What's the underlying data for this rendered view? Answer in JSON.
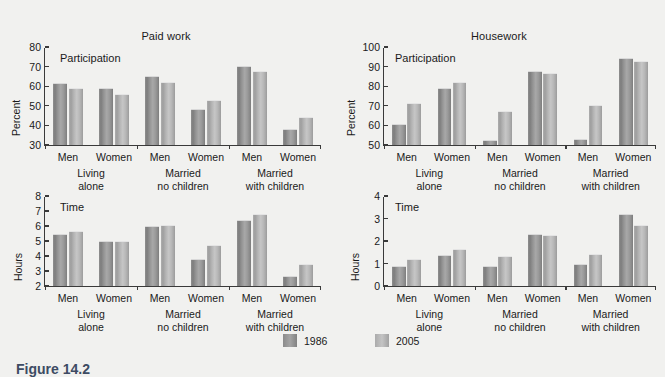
{
  "figure": {
    "caption": "Figure 14.2",
    "legend": [
      {
        "label": "1986",
        "key": "y1986",
        "color": "#8f8f8f"
      },
      {
        "label": "2005",
        "key": "y2005",
        "color": "#b4b4b4"
      }
    ]
  },
  "chart_data": [
    {
      "id": "paid-work-participation",
      "type": "bar",
      "title": "Paid work",
      "annotation": "Participation",
      "ylabel": "Percent",
      "xlabel": "",
      "ylim": [
        30,
        80
      ],
      "yticks": [
        30,
        40,
        50,
        60,
        70,
        80
      ],
      "grid": false,
      "legend_position": "bottom",
      "groups": [
        "Living alone",
        "Married no children",
        "Married with children"
      ],
      "categories": [
        "Men",
        "Women",
        "Men",
        "Women",
        "Men",
        "Women"
      ],
      "series": [
        {
          "name": "1986",
          "values": [
            61.5,
            59.2,
            65.3,
            48.2,
            70.3,
            38.3
          ]
        },
        {
          "name": "2005",
          "values": [
            59.0,
            56.2,
            62.0,
            53.1,
            68.0,
            44.2
          ]
        }
      ]
    },
    {
      "id": "housework-participation",
      "type": "bar",
      "title": "Housework",
      "annotation": "Participation",
      "ylabel": "Percent",
      "xlabel": "",
      "ylim": [
        50,
        100
      ],
      "yticks": [
        50,
        60,
        70,
        80,
        90,
        100
      ],
      "grid": false,
      "legend_position": "bottom",
      "groups": [
        "Living alone",
        "Married no children",
        "Married with children"
      ],
      "categories": [
        "Men",
        "Women",
        "Men",
        "Women",
        "Men",
        "Women"
      ],
      "series": [
        {
          "name": "1986",
          "values": [
            60.8,
            79.2,
            52.5,
            87.7,
            53.3,
            94.5
          ]
        },
        {
          "name": "2005",
          "values": [
            71.2,
            82.2,
            67.5,
            86.8,
            70.2,
            93.0
          ]
        }
      ]
    },
    {
      "id": "paid-work-time",
      "type": "bar",
      "title": "",
      "annotation": "Time",
      "ylabel": "Hours",
      "xlabel": "",
      "ylim": [
        2,
        8
      ],
      "yticks": [
        2,
        3,
        4,
        5,
        6,
        7,
        8
      ],
      "grid": false,
      "legend_position": "bottom",
      "groups": [
        "Living alone",
        "Married no children",
        "Married with children"
      ],
      "categories": [
        "Men",
        "Women",
        "Men",
        "Women",
        "Men",
        "Women"
      ],
      "series": [
        {
          "name": "1986",
          "values": [
            5.5,
            5.0,
            6.0,
            3.8,
            6.4,
            2.7
          ]
        },
        {
          "name": "2005",
          "values": [
            5.65,
            5.0,
            6.1,
            4.75,
            6.8,
            3.5
          ]
        }
      ]
    },
    {
      "id": "housework-time",
      "type": "bar",
      "title": "",
      "annotation": "Time",
      "ylabel": "Hours",
      "xlabel": "",
      "ylim": [
        0,
        4
      ],
      "yticks": [
        0,
        1,
        2,
        3,
        4
      ],
      "grid": false,
      "legend_position": "bottom",
      "groups": [
        "Living alone",
        "Married no children",
        "Married with children"
      ],
      "categories": [
        "Men",
        "Women",
        "Men",
        "Women",
        "Men",
        "Women"
      ],
      "series": [
        {
          "name": "1986",
          "values": [
            0.9,
            1.38,
            0.9,
            2.32,
            1.0,
            3.2
          ]
        },
        {
          "name": "2005",
          "values": [
            1.2,
            1.65,
            1.35,
            2.25,
            1.42,
            2.72
          ]
        }
      ]
    }
  ]
}
